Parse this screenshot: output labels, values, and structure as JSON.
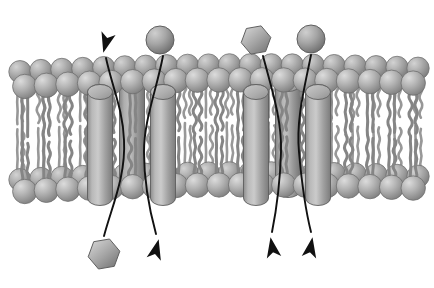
{
  "figure": {
    "background_color": "#ffffff",
    "width": 434,
    "height": 288
  },
  "palette": {
    "head_light": "#d2d2d2",
    "head_mid": "#a8a8a8",
    "head_dark": "#7d7d7d",
    "head_stroke": "#6f6f6f",
    "tail_color": "#8c8c8c",
    "tail_stroke": "#707070",
    "protein_light": "#c8c8c8",
    "protein_mid": "#a5a5a5",
    "protein_dark": "#7a7a7a",
    "protein_stroke": "#5e5e5e",
    "arrow_color": "#111111",
    "solute_light": "#c9c9c9",
    "solute_dark": "#737373"
  },
  "membrane": {
    "label": "phospholipid-bilayer",
    "upper_leaflet_label": "outer-leaflet-head-row",
    "lower_leaflet_label": "inner-leaflet-head-row",
    "tail_region_label": "hydrophobic-tail-region",
    "head_count_back_row": 20,
    "head_count_front_row": 19,
    "top_band_y": 78,
    "bottom_band_y": 188
  },
  "proteins": [
    {
      "name": "transmembrane-protein-1",
      "x": 100,
      "top": 92,
      "height": 106,
      "width": 25,
      "depth": "front"
    },
    {
      "name": "transmembrane-protein-2",
      "x": 132,
      "top": 84,
      "height": 106,
      "width": 25,
      "depth": "back"
    },
    {
      "name": "transmembrane-protein-3",
      "x": 163,
      "top": 92,
      "height": 106,
      "width": 25,
      "depth": "front"
    },
    {
      "name": "transmembrane-protein-4",
      "x": 256,
      "top": 92,
      "height": 106,
      "width": 25,
      "depth": "front"
    },
    {
      "name": "transmembrane-protein-5",
      "x": 288,
      "top": 84,
      "height": 106,
      "width": 25,
      "depth": "back"
    },
    {
      "name": "transmembrane-protein-6",
      "x": 318,
      "top": 92,
      "height": 106,
      "width": 25,
      "depth": "front"
    }
  ],
  "solutes": [
    {
      "name": "solute-sphere-top-left",
      "shape": "sphere",
      "cx": 160,
      "cy": 40,
      "r": 14
    },
    {
      "name": "solute-hexagon-top-right",
      "shape": "hexagon",
      "cx": 256,
      "cy": 40,
      "r": 15
    },
    {
      "name": "solute-sphere-top-right",
      "shape": "sphere",
      "cx": 311,
      "cy": 39,
      "r": 14
    },
    {
      "name": "solute-hexagon-bottom-left",
      "shape": "hexagon",
      "cx": 104,
      "cy": 254,
      "r": 16
    }
  ],
  "transport_paths": [
    {
      "name": "transport-path-outward-left",
      "direction": "outward",
      "arrowhead": "up-left",
      "note": "exits membrane upward through protein channel on the left"
    },
    {
      "name": "transport-path-inward-sphere-left",
      "direction": "inward",
      "arrowhead": "down-right",
      "note": "sphere enters through left channel pair"
    },
    {
      "name": "transport-path-inward-hexagon-right",
      "direction": "inward",
      "arrowhead": "down-left",
      "note": "hexagon enters through right channel"
    },
    {
      "name": "transport-path-inward-sphere-right",
      "direction": "inward",
      "arrowhead": "down-right",
      "note": "sphere enters through far right channel"
    }
  ]
}
